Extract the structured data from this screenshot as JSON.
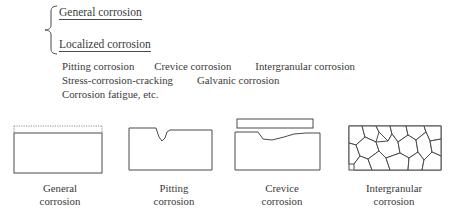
{
  "figure": {
    "classification": {
      "brace_icon": "curly-brace",
      "headings": [
        {
          "label": "General corrosion"
        },
        {
          "label": "Localized corrosion"
        }
      ],
      "localized_types": [
        [
          "Pitting corrosion",
          "Crevice corrosion",
          "Intergranular corrosion"
        ],
        [
          "Stress-corrosion-cracking",
          "Galvanic corrosion"
        ],
        [
          "Corrosion fatigue, etc."
        ]
      ]
    },
    "diagrams": [
      {
        "name": "general-corrosion",
        "caption_line1": "General",
        "caption_line2": "corrosion"
      },
      {
        "name": "pitting-corrosion",
        "caption_line1": "Pitting",
        "caption_line2": "corrosion"
      },
      {
        "name": "crevice-corrosion",
        "caption_line1": "Crevice",
        "caption_line2": "corrosion"
      },
      {
        "name": "intergranular-corrosion",
        "caption_line1": "Intergranular",
        "caption_line2": "corrosion"
      }
    ],
    "colors": {
      "line": "#4a4a4a",
      "dotted_line": "#8c8c8c",
      "text": "#3a3a3a",
      "background": "#ffffff"
    }
  }
}
